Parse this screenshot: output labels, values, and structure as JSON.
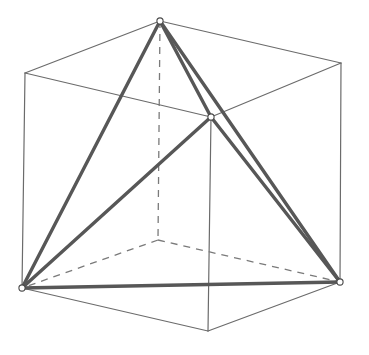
{
  "figure": {
    "canvas": {
      "width": 369,
      "height": 355,
      "background": "#ffffff"
    },
    "style": {
      "cube_visible_color": "#6b6b6b",
      "cube_hidden_color": "#7a7a7a",
      "tetra_color": "#575757",
      "vertex_fill": "#ffffff",
      "vertex_stroke": "#4a4a4a",
      "cube_visible_width": 1.2,
      "cube_hidden_width": 1.3,
      "cube_hidden_dash": "7 6",
      "tetra_width": 3.4,
      "vertex_radius": 3.1
    }
  },
  "chart_data": {
    "type": "diagram",
    "projection": "oblique parallel projection",
    "cube_vertices": [
      {
        "id": "top-back",
        "label": "A",
        "x": 160,
        "y": 21,
        "hidden": false,
        "is_tetra": true
      },
      {
        "id": "top-left",
        "label": "B",
        "x": 25,
        "y": 73,
        "hidden": false,
        "is_tetra": false
      },
      {
        "id": "top-front",
        "label": "C",
        "x": 211,
        "y": 117,
        "hidden": false,
        "is_tetra": true
      },
      {
        "id": "top-right",
        "label": "D",
        "x": 341,
        "y": 63,
        "hidden": false,
        "is_tetra": false
      },
      {
        "id": "bottom-back",
        "label": "E",
        "x": 158,
        "y": 240,
        "hidden": true,
        "is_tetra": false
      },
      {
        "id": "bottom-left",
        "label": "F",
        "x": 22,
        "y": 288,
        "hidden": false,
        "is_tetra": true
      },
      {
        "id": "bottom-front",
        "label": "G",
        "x": 208,
        "y": 331,
        "hidden": false,
        "is_tetra": false
      },
      {
        "id": "bottom-right",
        "label": "H",
        "x": 340,
        "y": 282,
        "hidden": false,
        "is_tetra": true
      }
    ],
    "cube_edges_visible": [
      {
        "from": "top-back",
        "to": "top-left"
      },
      {
        "from": "top-left",
        "to": "top-front"
      },
      {
        "from": "top-front",
        "to": "top-right"
      },
      {
        "from": "top-right",
        "to": "top-back"
      },
      {
        "from": "top-left",
        "to": "bottom-left"
      },
      {
        "from": "top-front",
        "to": "bottom-front"
      },
      {
        "from": "top-right",
        "to": "bottom-right"
      },
      {
        "from": "bottom-left",
        "to": "bottom-front"
      },
      {
        "from": "bottom-front",
        "to": "bottom-right"
      }
    ],
    "cube_edges_hidden": [
      {
        "from": "top-back",
        "to": "bottom-back"
      },
      {
        "from": "bottom-back",
        "to": "bottom-left"
      },
      {
        "from": "bottom-back",
        "to": "bottom-right"
      }
    ],
    "tetrahedron_vertices": [
      "top-back",
      "top-front",
      "bottom-left",
      "bottom-right"
    ],
    "tetrahedron_edges": [
      {
        "from": "top-back",
        "to": "top-front",
        "label": "edge-1"
      },
      {
        "from": "top-back",
        "to": "bottom-left",
        "label": "edge-2"
      },
      {
        "from": "top-back",
        "to": "bottom-right",
        "label": "edge-3"
      },
      {
        "from": "top-front",
        "to": "bottom-left",
        "label": "edge-4"
      },
      {
        "from": "top-front",
        "to": "bottom-right",
        "label": "edge-5"
      },
      {
        "from": "bottom-left",
        "to": "bottom-right",
        "label": "edge-6"
      }
    ],
    "annotations": [],
    "legend": [],
    "xlabel": "",
    "ylabel": ""
  }
}
